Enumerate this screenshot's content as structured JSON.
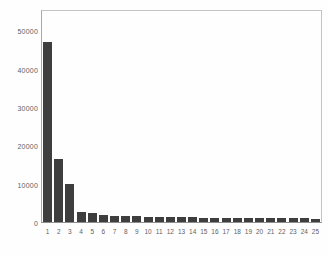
{
  "chart_data": {
    "type": "bar",
    "title": "",
    "xlabel": "",
    "ylabel": "",
    "categories": [
      "1",
      "2",
      "3",
      "4",
      "5",
      "6",
      "7",
      "8",
      "9",
      "10",
      "11",
      "12",
      "13",
      "14",
      "15",
      "16",
      "17",
      "18",
      "19",
      "20",
      "21",
      "22",
      "23",
      "24",
      "25"
    ],
    "values": [
      47000,
      16300,
      9800,
      2600,
      2250,
      1900,
      1650,
      1550,
      1500,
      1400,
      1350,
      1300,
      1250,
      1200,
      1150,
      1100,
      1080,
      1050,
      1020,
      1000,
      980,
      960,
      940,
      920,
      900
    ],
    "yticks": [
      0,
      10000,
      20000,
      30000,
      40000,
      50000
    ],
    "ytick_labels": [
      "0",
      "10000",
      "20000",
      "30000",
      "40000",
      "50000"
    ],
    "ylim": [
      0,
      55000
    ],
    "grid": false,
    "legend": null,
    "colors": {
      "bar": "#3e3e3e",
      "frame": "#c3c3c3",
      "axis_text": "#5f5f5f",
      "background": "#fefefe"
    }
  }
}
